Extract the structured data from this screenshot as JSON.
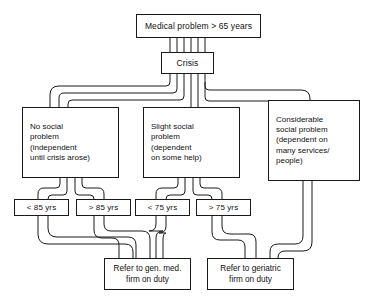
{
  "diagram": {
    "title_node": {
      "label": "Medical problem > 65 years"
    },
    "crisis_node": {
      "label": "Crisis"
    },
    "social_levels": [
      {
        "id": "none",
        "lines": [
          "No social",
          "problem",
          "(independent",
          "until crisis arose)"
        ]
      },
      {
        "id": "slight",
        "lines": [
          "Slight social",
          "problem",
          "(dependent",
          "on some help)"
        ]
      },
      {
        "id": "considerable",
        "lines": [
          "Considerable",
          "social problem",
          "(dependent on",
          "many services/",
          "people)"
        ]
      }
    ],
    "age_gates": [
      {
        "id": "lt85",
        "label": "< 85 yrs"
      },
      {
        "id": "gt85",
        "label": "> 85 yrs"
      },
      {
        "id": "lt75",
        "label": "< 75 yrs"
      },
      {
        "id": "gt75",
        "label": "> 75 yrs"
      }
    ],
    "outcomes": [
      {
        "id": "general-medical",
        "lines": [
          "Refer to gen. med.",
          "firm on duty"
        ]
      },
      {
        "id": "geriatric",
        "lines": [
          "Refer to geriatric",
          "firm on duty"
        ]
      }
    ],
    "colors": {
      "stroke": "#1a1a1a",
      "background": "#ffffff",
      "text": "#111111"
    }
  }
}
